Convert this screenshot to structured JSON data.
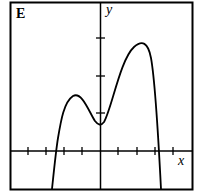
{
  "panel_label": "E",
  "axes": {
    "x_label": "x",
    "y_label": "y"
  },
  "graph": {
    "description": "Polynomial curve with a local max near x=-1.5, local min at x=0, global max near x=2.3; crosses x-axis near x=-2.35 and x=3.2",
    "x_ticks": [
      -4,
      -3,
      -2,
      -1,
      1,
      2,
      3,
      4
    ],
    "y_ticks": [
      1,
      2,
      3
    ],
    "key_points": [
      {
        "name": "left-root",
        "x": -2.35,
        "y": 0
      },
      {
        "name": "local-max",
        "x": -1.5,
        "y": 1.47
      },
      {
        "name": "local-min",
        "x": 0,
        "y": 0.69
      },
      {
        "name": "global-max",
        "x": 2.3,
        "y": 2.88
      },
      {
        "name": "right-root",
        "x": 3.2,
        "y": 0
      }
    ]
  },
  "colors": {
    "line": "#000000",
    "background": "#ffffff"
  }
}
